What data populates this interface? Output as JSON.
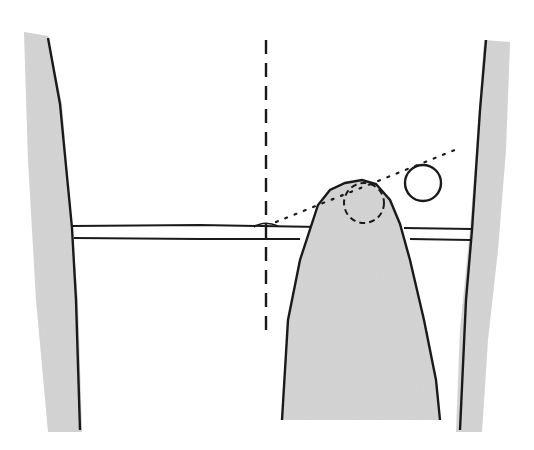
{
  "diagram": {
    "colors": {
      "background": "#ffffff",
      "line": "#1a1a1a",
      "shade": "#d4d4d4"
    },
    "elements": [
      {
        "id": "left-wall",
        "type": "shaded-wall"
      },
      {
        "id": "right-wall",
        "type": "shaded-wall"
      },
      {
        "id": "horizontal-bar",
        "type": "double-line"
      },
      {
        "id": "mound",
        "type": "shaded-shape"
      },
      {
        "id": "vertical-dashed-line",
        "type": "dashed-line"
      },
      {
        "id": "dashed-circle",
        "type": "dashed-circle"
      },
      {
        "id": "dotted-sight-line",
        "type": "dotted-line"
      },
      {
        "id": "open-circle",
        "type": "circle"
      },
      {
        "id": "small-bump",
        "type": "arc"
      }
    ]
  }
}
